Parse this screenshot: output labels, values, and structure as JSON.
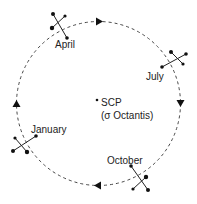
{
  "diagram": {
    "center": {
      "label_line1": "SCP",
      "label_line2": "(σ Octantis)"
    },
    "months": [
      {
        "id": "april",
        "label": "April"
      },
      {
        "id": "july",
        "label": "July"
      },
      {
        "id": "october",
        "label": "October"
      },
      {
        "id": "january",
        "label": "January"
      }
    ],
    "orbit": {
      "style": "dashed",
      "direction": "clockwise"
    },
    "colors": {
      "stroke": "#333333",
      "text": "#222222",
      "background": "#ffffff"
    }
  }
}
